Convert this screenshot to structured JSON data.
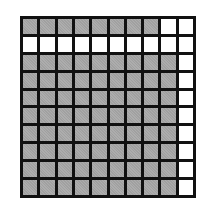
{
  "diagram": {
    "type": "hundred-grid",
    "rows": 10,
    "cols": 10,
    "colors": {
      "shaded": "#a9a9a9",
      "unshaded": "#ffffff",
      "border": "#111111"
    },
    "shaded_counts_by_row": [
      8,
      0,
      9,
      9,
      9,
      9,
      9,
      9,
      9,
      9
    ],
    "total_shaded": 80,
    "grid": [
      [
        1,
        1,
        1,
        1,
        1,
        1,
        1,
        1,
        0,
        0
      ],
      [
        0,
        0,
        0,
        0,
        0,
        0,
        0,
        0,
        0,
        0
      ],
      [
        1,
        1,
        1,
        1,
        1,
        1,
        1,
        1,
        1,
        0
      ],
      [
        1,
        1,
        1,
        1,
        1,
        1,
        1,
        1,
        1,
        0
      ],
      [
        1,
        1,
        1,
        1,
        1,
        1,
        1,
        1,
        1,
        0
      ],
      [
        1,
        1,
        1,
        1,
        1,
        1,
        1,
        1,
        1,
        0
      ],
      [
        1,
        1,
        1,
        1,
        1,
        1,
        1,
        1,
        1,
        0
      ],
      [
        1,
        1,
        1,
        1,
        1,
        1,
        1,
        1,
        1,
        0
      ],
      [
        1,
        1,
        1,
        1,
        1,
        1,
        1,
        1,
        1,
        0
      ],
      [
        1,
        1,
        1,
        1,
        1,
        1,
        1,
        1,
        1,
        0
      ]
    ]
  }
}
